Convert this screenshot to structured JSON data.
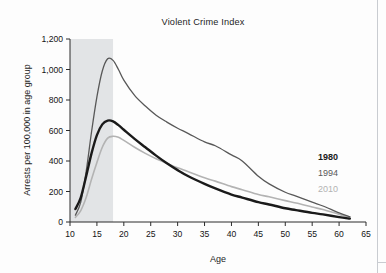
{
  "chart_data": {
    "type": "line",
    "title": "Violent Crime Index",
    "xlabel": "Age",
    "ylabel": "Arrests per 100,000 in age group",
    "xlim": [
      10,
      65
    ],
    "ylim": [
      0,
      1200
    ],
    "xticks": [
      "10",
      "15",
      "20",
      "25",
      "30",
      "35",
      "40",
      "45",
      "50",
      "55",
      "60",
      "65"
    ],
    "yticks": [
      "0",
      "200",
      "400",
      "600",
      "800",
      "1,000",
      "1,200"
    ],
    "grid": false,
    "legend_position": "right-inside",
    "shaded_region": {
      "label": "juvenile age band",
      "x_start": 10,
      "x_end": 18,
      "color": "#e2e4e6"
    },
    "x": [
      11,
      12,
      13,
      14,
      15,
      16,
      17,
      18,
      19,
      20,
      22,
      24,
      26,
      28,
      30,
      32,
      35,
      37,
      40,
      42,
      45,
      47,
      50,
      52,
      55,
      57,
      60,
      62
    ],
    "series": [
      {
        "name": "1980",
        "color": "#1a1a1a",
        "width": 2.4,
        "values": [
          85,
          160,
          300,
          450,
          570,
          640,
          665,
          660,
          635,
          605,
          545,
          490,
          435,
          385,
          340,
          300,
          250,
          220,
          180,
          160,
          130,
          115,
          90,
          78,
          60,
          50,
          32,
          22
        ]
      },
      {
        "name": "1994",
        "color": "#585858",
        "width": 1.3,
        "values": [
          45,
          130,
          330,
          590,
          820,
          990,
          1070,
          1060,
          1000,
          930,
          830,
          760,
          700,
          655,
          615,
          580,
          525,
          500,
          440,
          400,
          300,
          250,
          195,
          170,
          130,
          105,
          60,
          35
        ]
      },
      {
        "name": "2010",
        "color": "#b3b3b3",
        "width": 1.6,
        "values": [
          30,
          75,
          160,
          280,
          390,
          490,
          550,
          562,
          555,
          535,
          490,
          450,
          415,
          385,
          355,
          330,
          290,
          268,
          232,
          212,
          180,
          165,
          140,
          125,
          98,
          82,
          50,
          30
        ]
      }
    ]
  }
}
